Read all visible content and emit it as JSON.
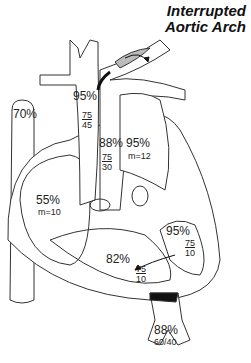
{
  "title": {
    "line1": "Interrupted",
    "line2": "Aortic Arch"
  },
  "labels": {
    "svc_sat": "70%",
    "ascending_aorta_sat": "95%",
    "ascending_aorta_pressure": {
      "num": "75",
      "den": "45"
    },
    "pa_sat": "88%",
    "pa_pressure": {
      "num": "75",
      "den": "30"
    },
    "la_sat": "95%",
    "la_mean": "m=12",
    "ra_sat": "55%",
    "ra_mean": "m=10",
    "lv_sat": "95%",
    "lv_pressure": {
      "num": "75",
      "den": "10"
    },
    "rv_sat": "82%",
    "rv_pressure": {
      "num": "75",
      "den": "10"
    },
    "descending_aorta_sat": "88%",
    "descending_aorta_pressure": "60/40"
  },
  "colors": {
    "line": "#333333",
    "shade": "#bbbbbb",
    "black": "#111111"
  }
}
